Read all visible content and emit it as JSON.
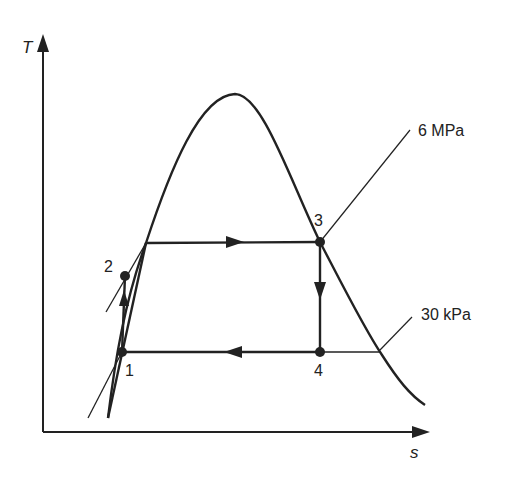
{
  "diagram": {
    "type": "T-s diagram (Rankine cycle)",
    "axes": {
      "y_label": "T",
      "x_label": "s"
    },
    "states": [
      {
        "id": "1",
        "label": "1"
      },
      {
        "id": "2",
        "label": "2"
      },
      {
        "id": "3",
        "label": "3"
      },
      {
        "id": "4",
        "label": "4"
      }
    ],
    "isobars": [
      {
        "label": "6 MPa"
      },
      {
        "label": "30 kPa"
      }
    ],
    "processes": [
      {
        "from": "1",
        "to": "2",
        "direction": "up"
      },
      {
        "from": "2",
        "to": "3",
        "direction": "right"
      },
      {
        "from": "3",
        "to": "4",
        "direction": "down"
      },
      {
        "from": "4",
        "to": "1",
        "direction": "left"
      }
    ],
    "colors": {
      "line": "#222222",
      "background": "#ffffff"
    }
  }
}
